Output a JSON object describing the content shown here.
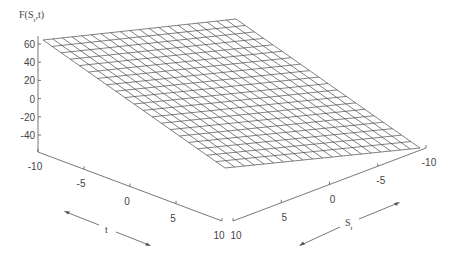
{
  "chart_data": {
    "type": "surface",
    "title": "",
    "zlabel": "F(S_t,t)",
    "xlabel": "t",
    "ylabel": "S_t",
    "z_ticks": [
      "60",
      "40",
      "20",
      "0",
      "-20",
      "-40"
    ],
    "t_ticks": [
      "-10",
      "-5",
      "0",
      "5",
      "10"
    ],
    "s_ticks": [
      "10",
      "5",
      "0",
      "-5",
      "-10"
    ],
    "t_range": [
      -10,
      10
    ],
    "s_range": [
      -10,
      10
    ],
    "z_range": [
      -50,
      65
    ],
    "grid": "wireframe",
    "mesh_divisions": 20,
    "corners": {
      "t_-10_s_-10": 65,
      "t_-10_s_10": 65,
      "t_10_s_-10": -25,
      "t_10_s_10": -50
    },
    "line_color": "#444444"
  }
}
